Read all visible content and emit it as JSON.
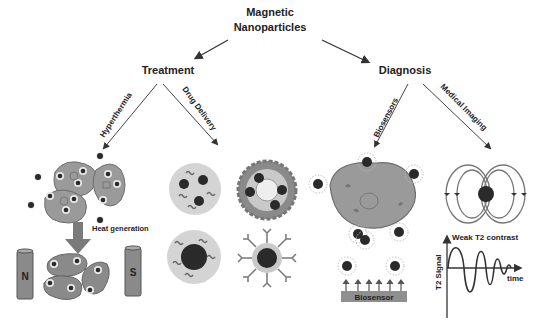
{
  "root": {
    "line1": "Magnetic",
    "line2": "Nanoparticles"
  },
  "branches": {
    "treatment": {
      "label": "Treatment",
      "sub": [
        {
          "label": "Hyperthermia"
        },
        {
          "label": "Drug Delivery"
        }
      ]
    },
    "diagnosis": {
      "label": "Diagnosis",
      "sub": [
        {
          "label": "Biosensors"
        },
        {
          "label": "Medical Imaging"
        }
      ]
    }
  },
  "hyperthermia": {
    "heat_label": "Heat generation",
    "magnet_north": "N",
    "magnet_south": "S"
  },
  "biosensor": {
    "label": "Biosensor"
  },
  "imaging": {
    "contrast_label": "Weak T2 contrast",
    "y_axis": "T2 Signal",
    "x_axis": "time"
  },
  "colors": {
    "cell_fill": "#9a9a9a",
    "cell_stroke": "#6e6e6e",
    "particle": "#2a2a2a",
    "carrier_fill": "#d4d4d4",
    "text": "#222222"
  }
}
